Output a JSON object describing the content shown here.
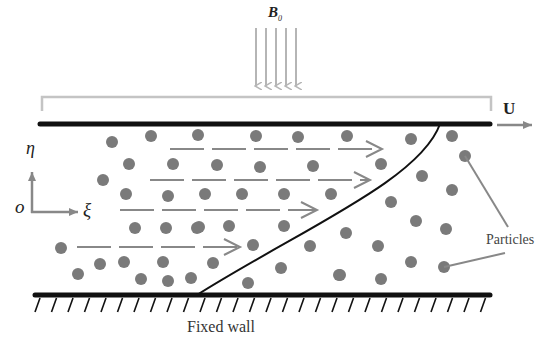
{
  "labels": {
    "magnetic_field": "B",
    "magnetic_field_subscript": "0",
    "plate_velocity": "U",
    "axis_vertical": "η",
    "axis_origin": "o",
    "axis_horizontal": "ξ",
    "particles": "Particles",
    "fixed_wall": "Fixed wall"
  },
  "colors": {
    "plate": "#111111",
    "particle": "#7a7a7a",
    "arrow": "#888888",
    "field_arrow": "#b5b5b5",
    "bracket": "#c4c4c4",
    "profile": "#111111"
  },
  "particles": [
    [
      112,
      142
    ],
    [
      151,
      136
    ],
    [
      129,
      164
    ],
    [
      173,
      164
    ],
    [
      103,
      180
    ],
    [
      126,
      194
    ],
    [
      168,
      196
    ],
    [
      135,
      228
    ],
    [
      166,
      228
    ],
    [
      197,
      228
    ],
    [
      61,
      248
    ],
    [
      100,
      264
    ],
    [
      124,
      262
    ],
    [
      163,
      262
    ],
    [
      78,
      274
    ],
    [
      141,
      279
    ],
    [
      168,
      281
    ],
    [
      191,
      278
    ],
    [
      198,
      135
    ],
    [
      256,
      136
    ],
    [
      298,
      137
    ],
    [
      217,
      165
    ],
    [
      260,
      167
    ],
    [
      313,
      166
    ],
    [
      205,
      194
    ],
    [
      242,
      194
    ],
    [
      284,
      194
    ],
    [
      331,
      194
    ],
    [
      199,
      227
    ],
    [
      229,
      226
    ],
    [
      284,
      226
    ],
    [
      253,
      245
    ],
    [
      310,
      246
    ],
    [
      213,
      263
    ],
    [
      281,
      268
    ],
    [
      248,
      283
    ],
    [
      340,
      275
    ],
    [
      347,
      136
    ],
    [
      411,
      139
    ],
    [
      452,
      136
    ],
    [
      381,
      164
    ],
    [
      465,
      156
    ],
    [
      422,
      176
    ],
    [
      452,
      190
    ],
    [
      391,
      202
    ],
    [
      416,
      221
    ],
    [
      446,
      229
    ],
    [
      346,
      233
    ],
    [
      378,
      246
    ],
    [
      411,
      262
    ],
    [
      339,
      275
    ],
    [
      381,
      279
    ],
    [
      444,
      267
    ]
  ],
  "dashed_arrows": [
    {
      "y": 149,
      "x1": 170,
      "x2": 382
    },
    {
      "y": 180,
      "x1": 150,
      "x2": 370
    },
    {
      "y": 210,
      "x1": 120,
      "x2": 317
    },
    {
      "y": 247,
      "x1": 77,
      "x2": 240
    }
  ],
  "field_arrows_x": [
    256,
    266,
    276,
    286,
    296
  ]
}
